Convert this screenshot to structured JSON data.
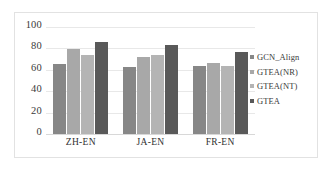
{
  "chart_data": {
    "type": "bar",
    "title": "",
    "xlabel": "",
    "ylabel": "",
    "categories": [
      "ZH-EN",
      "JA-EN",
      "FR-EN"
    ],
    "series": [
      {
        "name": "GCN_Align",
        "color": "#878787",
        "values": [
          65,
          63,
          64
        ]
      },
      {
        "name": "GTEA(NR)",
        "color": "#a8a8a8",
        "values": [
          79,
          72,
          66
        ]
      },
      {
        "name": "GTEA(NT)",
        "color": "#b4b4b4",
        "values": [
          74,
          74,
          64
        ]
      },
      {
        "name": "GTEA",
        "color": "#595959",
        "values": [
          86,
          83,
          77
        ]
      }
    ],
    "ylim": [
      0,
      100
    ],
    "yticks": [
      "100",
      "80",
      "60",
      "40",
      "20",
      "0"
    ],
    "ytick_values": [
      100,
      80,
      60,
      40,
      20,
      0
    ],
    "grid": true,
    "legend_position": "right",
    "gridline_color": "#e8e8e8",
    "frame_color": "#e2e2e2",
    "background": "#ffffff"
  }
}
